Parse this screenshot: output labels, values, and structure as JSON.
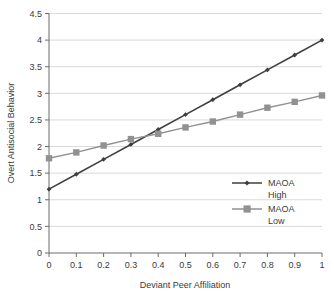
{
  "chart_data": {
    "type": "line",
    "title": "",
    "xlabel": "Deviant Peer Affiliation",
    "ylabel": "Overt Antisocial Behavior",
    "x": [
      0,
      0.1,
      0.2,
      0.3,
      0.4,
      0.5,
      0.6,
      0.7,
      0.8,
      0.9,
      1
    ],
    "xtick_labels": [
      "0",
      "0.1",
      "0.2",
      "0.3",
      "0.4",
      "0.5",
      "0.6",
      "0.7",
      "0.8",
      "0.9",
      "1"
    ],
    "ytick_labels": [
      "0",
      "0.5",
      "1",
      "1.5",
      "2",
      "2.5",
      "3",
      "3.5",
      "4",
      "4.5"
    ],
    "ytick_values": [
      0,
      0.5,
      1,
      1.5,
      2,
      2.5,
      3,
      3.5,
      4,
      4.5
    ],
    "xlim": [
      0,
      1
    ],
    "ylim": [
      0,
      4.5
    ],
    "grid": "horizontal",
    "legend_position": "inside-right",
    "series": [
      {
        "name": "MAOA High",
        "label_line1": "MAOA",
        "label_line2": "High",
        "color": "#3f3f3f",
        "marker": "diamond",
        "values": [
          1.2,
          1.48,
          1.76,
          2.04,
          2.32,
          2.6,
          2.88,
          3.16,
          3.44,
          3.72,
          4.0
        ]
      },
      {
        "name": "MAOA Low",
        "label_line1": "MAOA",
        "label_line2": "Low",
        "color": "#919191",
        "marker": "square",
        "values": [
          1.78,
          1.89,
          2.02,
          2.14,
          2.24,
          2.36,
          2.47,
          2.6,
          2.73,
          2.84,
          2.96
        ]
      }
    ]
  },
  "colors": {
    "series_high": "#3f3f3f",
    "series_low": "#919191",
    "axis": "#6b6b6b",
    "grid": "#d9d9d9",
    "text": "#3b3b3b",
    "background": "#ffffff"
  }
}
